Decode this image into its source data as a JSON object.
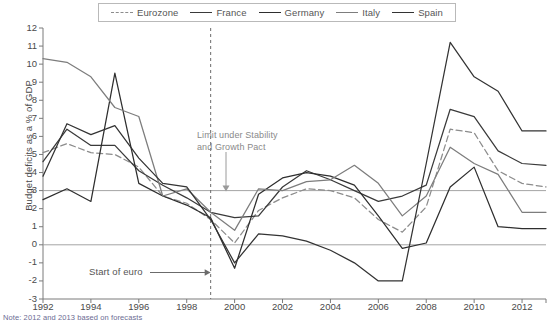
{
  "chart_data": {
    "type": "line",
    "title": "",
    "xlabel": "",
    "ylabel": "Budget deficits as a % of GDP",
    "xlim": [
      1992,
      2013
    ],
    "ylim": [
      -3,
      12
    ],
    "ytick_labels": [
      "12",
      "11",
      "10",
      "9",
      "8",
      "7",
      "6",
      "5",
      "4",
      "3",
      "2",
      "1",
      "0",
      "-1",
      "-2",
      "-3"
    ],
    "xtick_labels": [
      "1992",
      "1994",
      "1996",
      "1998",
      "2000",
      "2002",
      "2004",
      "2006",
      "2008",
      "2010",
      "2012"
    ],
    "grid": false,
    "legend_position": "top",
    "x": [
      1992,
      1993,
      1994,
      1995,
      1996,
      1997,
      1998,
      1999,
      2000,
      2001,
      2002,
      2003,
      2004,
      2005,
      2006,
      2007,
      2008,
      2009,
      2010,
      2011,
      2012,
      2013
    ],
    "series": [
      {
        "name": "Eurozone",
        "style": "dashed",
        "color": "#8c8c8c",
        "values": [
          5.1,
          5.6,
          5.1,
          5.0,
          4.3,
          2.7,
          2.3,
          1.4,
          0.1,
          1.9,
          2.6,
          3.1,
          3.0,
          2.6,
          1.4,
          0.7,
          2.1,
          6.4,
          6.2,
          4.1,
          3.4,
          3.2
        ]
      },
      {
        "name": "France",
        "style": "solid",
        "color": "#3a3a3a",
        "values": [
          4.6,
          6.4,
          5.5,
          5.5,
          4.1,
          3.3,
          2.6,
          1.8,
          1.5,
          1.6,
          3.2,
          4.1,
          3.6,
          3.0,
          2.4,
          2.7,
          3.3,
          7.5,
          7.1,
          5.2,
          4.5,
          4.4
        ]
      },
      {
        "name": "Germany",
        "style": "solid",
        "color": "#2e2e2e",
        "values": [
          2.5,
          3.1,
          2.4,
          9.5,
          3.4,
          2.7,
          2.2,
          1.5,
          -1.3,
          2.8,
          3.7,
          4.0,
          3.8,
          3.3,
          1.6,
          -0.2,
          0.1,
          3.2,
          4.3,
          1.0,
          0.9,
          0.9
        ]
      },
      {
        "name": "Italy",
        "style": "solid",
        "color": "#7d7d7d",
        "values": [
          10.3,
          10.1,
          9.3,
          7.6,
          7.1,
          2.7,
          3.1,
          1.8,
          0.8,
          3.1,
          3.0,
          3.5,
          3.6,
          4.4,
          3.4,
          1.6,
          2.7,
          5.4,
          4.5,
          3.9,
          1.8,
          1.8
        ]
      },
      {
        "name": "Spain",
        "style": "solid",
        "color": "#333333",
        "values": [
          3.8,
          6.7,
          6.1,
          6.6,
          4.8,
          3.4,
          3.2,
          1.4,
          -1.0,
          0.6,
          0.5,
          0.2,
          -0.3,
          -1.0,
          -2.0,
          -2.0,
          4.5,
          11.2,
          9.3,
          8.5,
          6.3,
          6.3
        ]
      }
    ],
    "reference_lines": [
      {
        "name": "stability-pact-limit",
        "axis": "y",
        "value": 3,
        "color": "#9a9a9a"
      },
      {
        "name": "zero-line",
        "axis": "y",
        "value": 0,
        "color": "#9a9a9a"
      },
      {
        "name": "euro-start",
        "axis": "x",
        "value": 1999,
        "style": "dashed",
        "color": "#6b6b6b"
      }
    ],
    "annotations": [
      {
        "name": "limit-annotation",
        "text_line1": "Limit under Stability",
        "text_line2": "and Growth Pact",
        "points_to": 3
      },
      {
        "name": "euro-start-annotation",
        "text": "Start of euro",
        "points_to": 1999
      }
    ],
    "note": "Note: 2012 and 2013 based on forecasts"
  },
  "legend": {
    "items": [
      {
        "label": "Eurozone",
        "style": "dashed",
        "color": "#8c8c8c"
      },
      {
        "label": "France",
        "style": "solid",
        "color": "#3a3a3a"
      },
      {
        "label": "Germany",
        "style": "solid",
        "color": "#2e2e2e"
      },
      {
        "label": "Italy",
        "style": "solid",
        "color": "#7d7d7d"
      },
      {
        "label": "Spain",
        "style": "solid",
        "color": "#333333"
      }
    ]
  },
  "axes": {
    "y_label": "Budget deficits as a % of GDP",
    "y_ticks": [
      "12",
      "11",
      "10",
      "9",
      "8",
      "7",
      "6",
      "5",
      "4",
      "3",
      "2",
      "1",
      "0",
      "-1",
      "-2",
      "-3"
    ],
    "x_ticks": [
      "1992",
      "1994",
      "1996",
      "1998",
      "2000",
      "2002",
      "2004",
      "2006",
      "2008",
      "2010",
      "2012"
    ]
  },
  "annotations": {
    "limit_line1": "Limit under Stability",
    "limit_line2": "and Growth Pact",
    "euro_start": "Start of euro"
  },
  "footer": {
    "note": "Note: 2012 and 2013 based on forecasts"
  }
}
